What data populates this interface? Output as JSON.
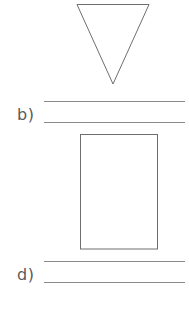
{
  "worksheet": {
    "items": [
      {
        "id": "a",
        "shape": "inverted-triangle",
        "label": "",
        "answer_lines": 0
      },
      {
        "id": "b",
        "shape": "",
        "label": "b)",
        "answer_lines": 2
      },
      {
        "id": "c",
        "shape": "rectangle",
        "label": "",
        "answer_lines": 0
      },
      {
        "id": "d",
        "shape": "",
        "label": "d)",
        "answer_lines": 2
      }
    ],
    "colors": {
      "shape_stroke": "#6e6e6e",
      "line_color": "#8a8a8a",
      "label_color": "#5a5a5a",
      "background": "#ffffff"
    }
  }
}
